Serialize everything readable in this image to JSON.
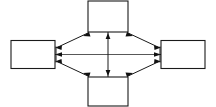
{
  "canvas": {
    "width": 216,
    "height": 107,
    "background_color": "#ffffff",
    "line_color": "#1a1a1a"
  },
  "diagram": {
    "title": "",
    "type": "four-node-bidirectional-network",
    "node_shape": "rectangle",
    "nodes": [
      {
        "id": "top",
        "label": "",
        "x": 108,
        "y": 16,
        "width": 40,
        "height": 30,
        "position": "top"
      },
      {
        "id": "left",
        "label": "",
        "x": 33,
        "y": 54.5,
        "width": 44,
        "height": 28,
        "position": "left"
      },
      {
        "id": "right",
        "label": "",
        "x": 185,
        "y": 54.5,
        "width": 44,
        "height": 28,
        "position": "right"
      },
      {
        "id": "bottom",
        "label": "",
        "x": 108,
        "y": 91,
        "width": 40,
        "height": 30,
        "position": "bottom"
      }
    ],
    "vertices": [
      {
        "id": "left-hub",
        "x": 56,
        "y": 54.5
      },
      {
        "id": "right-hub",
        "x": 160,
        "y": 54.5
      },
      {
        "id": "center-hub",
        "x": 108,
        "y": 54.5
      }
    ],
    "edges": [
      {
        "id": "edge-top-left-diag",
        "from": "top",
        "to": "left-hub",
        "arrow": "both",
        "style": "diagonal"
      },
      {
        "id": "edge-top-right-diag",
        "from": "top",
        "to": "right-hub",
        "arrow": "both",
        "style": "diagonal"
      },
      {
        "id": "edge-bottom-left-diag",
        "from": "bottom",
        "to": "left-hub",
        "arrow": "both",
        "style": "diagonal"
      },
      {
        "id": "edge-bottom-right-diag",
        "from": "bottom",
        "to": "right-hub",
        "arrow": "both",
        "style": "diagonal"
      },
      {
        "id": "edge-horizontal-axis",
        "from": "left-hub",
        "to": "right-hub",
        "arrow": "both",
        "style": "horizontal"
      },
      {
        "id": "edge-vertical-axis",
        "from": "top",
        "to": "bottom",
        "arrow": "both",
        "style": "vertical"
      },
      {
        "id": "edge-left-hub-to-box",
        "from": "left-hub",
        "to": "left",
        "arrow": "into-box",
        "style": "horizontal"
      },
      {
        "id": "edge-right-hub-to-box",
        "from": "right-hub",
        "to": "right",
        "arrow": "into-box",
        "style": "horizontal"
      }
    ],
    "arrow_count": 12,
    "legend": []
  }
}
